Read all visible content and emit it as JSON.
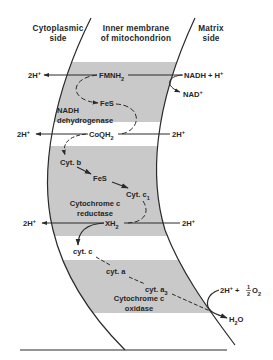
{
  "headers": {
    "cytoplasmic_line1": "Cytoplasmic",
    "cytoplasmic_line2": "side",
    "membrane_line1": "Inner membrane",
    "membrane_line2": "of mitochondrion",
    "matrix_line1": "Matrix",
    "matrix_line2": "side"
  },
  "complexes": [
    {
      "name_line1": "NADH",
      "name_line2": "dehydrogenase"
    },
    {
      "name_line1": "Cytochrome c",
      "name_line2": "reductase"
    },
    {
      "name_line1": "Cytochrome c",
      "name_line2": "oxidase"
    }
  ],
  "carriers": {
    "fmnh2": "FMNH",
    "fmnh2_sub": "2",
    "fes1": "FeS",
    "coqh2": "CoQH",
    "coqh2_sub": "2",
    "cytb": "Cyt. b",
    "fes2": "FeS",
    "cytc1": "Cyt. c",
    "cytc1_sub": "1",
    "xh2": "XH",
    "xh2_sub": "2",
    "cytc": "cyt. c",
    "cyta": "cyt. a",
    "cyta3": "cyt. a",
    "cyta3_sub": "3"
  },
  "protons": {
    "out1": "2H",
    "out2": "2H",
    "out3": "2H",
    "in2": "2H",
    "in3": "2H",
    "sup": "+"
  },
  "substrates": {
    "nadh": "NADH + H",
    "nadh_sup": "+",
    "nad": "NAD",
    "nad_sup": "+",
    "o2_prefix": "2H",
    "o2_sup": "+",
    "o2_plus": "+",
    "o2_half_num": "1",
    "o2_half_den": "2",
    "o2_o": "O",
    "o2_sub": "2",
    "water_h": "H",
    "water_sub": "2",
    "water_o": "O"
  },
  "colors": {
    "band": "#c9c9c9",
    "line": "#2a2a2a",
    "background": "#ffffff"
  }
}
